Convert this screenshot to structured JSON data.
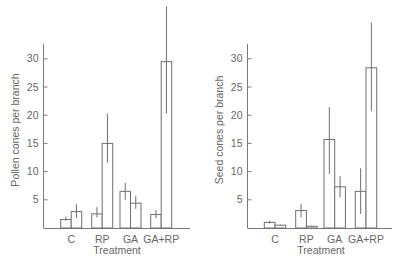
{
  "chart_data": [
    {
      "type": "bar",
      "title": "",
      "xlabel": "Treatment",
      "ylabel": "Pollen cones per branch",
      "categories": [
        "C",
        "RP",
        "GA",
        "GA+RP"
      ],
      "yticks": [
        5,
        10,
        15,
        20,
        25,
        30
      ],
      "ylim": [
        0,
        33
      ],
      "grid": false,
      "legend": null,
      "series": [
        {
          "name": "bar 1",
          "values": [
            1.5,
            2.5,
            6.5,
            2.4
          ],
          "err_low": [
            1.3,
            1.9,
            5.0,
            1.7
          ],
          "err_high": [
            2.0,
            3.7,
            8.0,
            3.2
          ]
        },
        {
          "name": "bar 2",
          "values": [
            2.9,
            15.0,
            4.4,
            29.5
          ],
          "err_low": [
            1.8,
            11.6,
            3.4,
            20.3
          ],
          "err_high": [
            4.2,
            20.3,
            5.7,
            39.3
          ]
        }
      ]
    },
    {
      "type": "bar",
      "title": "",
      "xlabel": "Treatment",
      "ylabel": "Seed cones per branch",
      "categories": [
        "C",
        "RP",
        "GA",
        "GA+RP"
      ],
      "yticks": [
        5,
        10,
        15,
        20,
        25,
        30
      ],
      "ylim": [
        0,
        33
      ],
      "grid": false,
      "legend": null,
      "series": [
        {
          "name": "bar 1",
          "values": [
            1.0,
            3.1,
            15.7,
            6.5
          ],
          "err_low": [
            0.8,
            1.9,
            9.6,
            2.5
          ],
          "err_high": [
            1.3,
            4.3,
            21.4,
            10.6
          ]
        },
        {
          "name": "bar 2",
          "values": [
            0.5,
            0.3,
            7.3,
            28.4
          ],
          "err_low": [
            0.4,
            0.2,
            5.4,
            20.7
          ],
          "err_high": [
            0.6,
            0.4,
            9.2,
            36.4
          ]
        }
      ]
    }
  ],
  "panels": [
    {
      "ylabel": "Pollen cones per branch",
      "xlabel": "Treatment",
      "categories": [
        "C",
        "RP",
        "GA",
        "GA+RP"
      ],
      "ticks": [
        "5",
        "10",
        "15",
        "20",
        "25",
        "30"
      ]
    },
    {
      "ylabel": "Seed cones per branch",
      "xlabel": "Treatment",
      "categories": [
        "C",
        "RP",
        "GA",
        "GA+RP"
      ],
      "ticks": [
        "5",
        "10",
        "15",
        "20",
        "25",
        "30"
      ]
    }
  ]
}
